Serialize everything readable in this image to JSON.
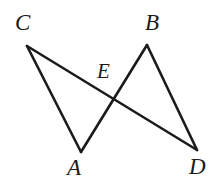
{
  "figure": {
    "kind": "geometry-diagram",
    "background_color": "#ffffff",
    "stroke_color": "#1b1b1b",
    "stroke_width": 2.6,
    "label_color": "#1b1b1b",
    "width": 217,
    "height": 196,
    "points": {
      "C": {
        "label": "C",
        "x": 27,
        "y": 46,
        "label_x": 15,
        "label_y": 11
      },
      "B": {
        "label": "B",
        "x": 147,
        "y": 45,
        "label_x": 145,
        "label_y": 11
      },
      "E": {
        "label": "E",
        "x": 113,
        "y": 101,
        "label_x": 97,
        "label_y": 61
      },
      "A": {
        "label": "A",
        "x": 81,
        "y": 152,
        "label_x": 67,
        "label_y": 156
      },
      "D": {
        "label": "D",
        "x": 197,
        "y": 150,
        "label_x": 189,
        "label_y": 155
      }
    },
    "segments": [
      {
        "name": "segment-CA",
        "from": "C",
        "to": "A",
        "x1": 27,
        "y1": 46,
        "x2": 81,
        "y2": 152
      },
      {
        "name": "segment-CD",
        "from": "C",
        "to": "D",
        "x1": 27,
        "y1": 46,
        "x2": 197,
        "y2": 150
      },
      {
        "name": "segment-AB",
        "from": "A",
        "to": "B",
        "x1": 81,
        "y1": 152,
        "x2": 147,
        "y2": 45
      },
      {
        "name": "segment-BD",
        "from": "B",
        "to": "D",
        "x1": 147,
        "y1": 45,
        "x2": 197,
        "y2": 150
      }
    ],
    "intersection": {
      "name": "E",
      "x": 113,
      "y": 101
    }
  }
}
